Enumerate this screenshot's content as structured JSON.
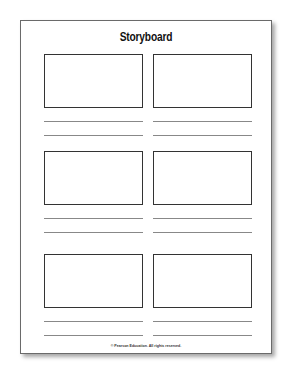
{
  "document": {
    "title": "Storyboard",
    "footer": "© Pearson Education. All rights reserved.",
    "panels": [
      {
        "row": 1,
        "col": 1,
        "caption_lines": 2
      },
      {
        "row": 1,
        "col": 2,
        "caption_lines": 2
      },
      {
        "row": 2,
        "col": 1,
        "caption_lines": 2
      },
      {
        "row": 2,
        "col": 2,
        "caption_lines": 2
      },
      {
        "row": 3,
        "col": 1,
        "caption_lines": 2
      },
      {
        "row": 3,
        "col": 2,
        "caption_lines": 2
      }
    ]
  }
}
